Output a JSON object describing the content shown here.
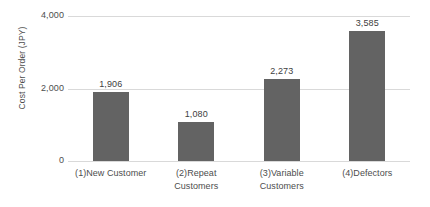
{
  "chart_data": {
    "type": "bar",
    "title": "",
    "xlabel": "",
    "ylabel": "Cost Per Order (JPY)",
    "categories": [
      "(1)New Customer",
      "(2)Repeat Customers",
      "(3)Variable Customers",
      "(4)Defectors"
    ],
    "values": [
      1906,
      1080,
      2273,
      3585
    ],
    "value_labels": [
      "1,906",
      "1,080",
      "2,273",
      "3,585"
    ],
    "ylim": [
      0,
      4000
    ],
    "yticks": [
      0,
      2000,
      4000
    ],
    "ytick_labels": [
      "0",
      "2,000",
      "4,000"
    ],
    "grid": true,
    "legend": "none",
    "bar_color": "#636363",
    "gridline_color": "#d9d9d9",
    "text_color": "#4d4d4d"
  }
}
